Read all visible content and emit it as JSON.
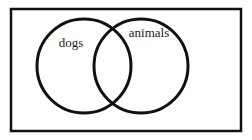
{
  "figure": {
    "name": "venn-diagram",
    "type": "venn-diagram",
    "background_color": "#ffffff",
    "stroke_color": "#111111",
    "text_color": "#1a1a1a"
  },
  "universe_box": {
    "name": "universal-set-rectangle",
    "x": 11,
    "y": 9,
    "width": 230,
    "height": 122,
    "stroke_width": 2.5,
    "fill": "none"
  },
  "circles": [
    {
      "id": "left",
      "label": "dogs",
      "cx": 84,
      "cy": 66,
      "r": 47,
      "stroke_width": 3,
      "fill": "none",
      "label_x": 71,
      "label_y": 44,
      "label_anchor": "middle"
    },
    {
      "id": "right",
      "label": "animals",
      "cx": 141,
      "cy": 66,
      "r": 47,
      "stroke_width": 3,
      "fill": "none",
      "label_x": 149,
      "label_y": 34,
      "label_anchor": "middle"
    }
  ],
  "labels": {
    "left_circle": "dogs",
    "right_circle": "animals"
  }
}
